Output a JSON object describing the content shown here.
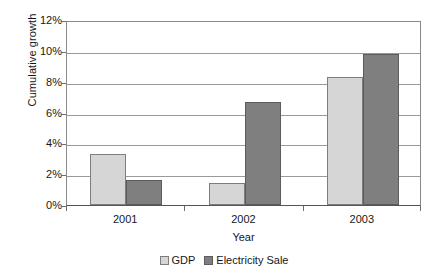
{
  "chart_data": {
    "type": "bar",
    "title": "",
    "xlabel": "Year",
    "ylabel": "Cumulative growth",
    "categories": [
      "2001",
      "2002",
      "2003"
    ],
    "series": [
      {
        "name": "GDP",
        "color": "#d6d6d6",
        "values": [
          3.3,
          1.4,
          8.3
        ]
      },
      {
        "name": "Electricity Sale",
        "color": "#7f7f7f",
        "values": [
          1.6,
          6.7,
          9.8
        ]
      }
    ],
    "ylim": [
      0,
      12
    ],
    "ytick_values": [
      0,
      2,
      4,
      6,
      8,
      10,
      12
    ],
    "ytick_labels": [
      "0%",
      "2%",
      "4%",
      "6%",
      "8%",
      "10%",
      "12%"
    ],
    "value_suffix": "%",
    "grid": true,
    "grid_axis": "y",
    "legend_position": "bottom",
    "background": "#ffffff",
    "axis_color": "#8a8a8a",
    "gridline_color": "#9a9a9a"
  }
}
